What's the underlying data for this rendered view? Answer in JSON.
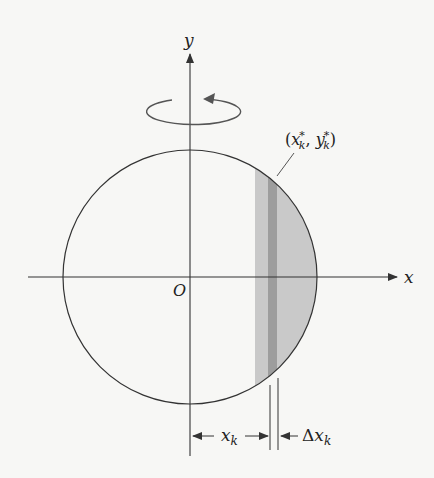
{
  "figure": {
    "type": "diagram",
    "axes": {
      "x_label": "x",
      "y_label": "y",
      "origin_label": "O"
    },
    "point_label": {
      "open": "(",
      "x": "x",
      "x_sub": "k",
      "x_sup": "*",
      "sep": ", ",
      "y": "y",
      "y_sub": "k",
      "y_sup": "*",
      "close": ")"
    },
    "dimensions": {
      "xk": {
        "var": "x",
        "sub": "k"
      },
      "dxk": {
        "delta": "Δ",
        "var": "x",
        "sub": "k"
      }
    },
    "rotation_indicator": "counter-clockwise rotation about y-axis",
    "colors": {
      "line": "#333333",
      "shade_light": "#c9c9c9",
      "shade_dark": "#9a9a9a",
      "background": "#f7f7f5"
    }
  }
}
